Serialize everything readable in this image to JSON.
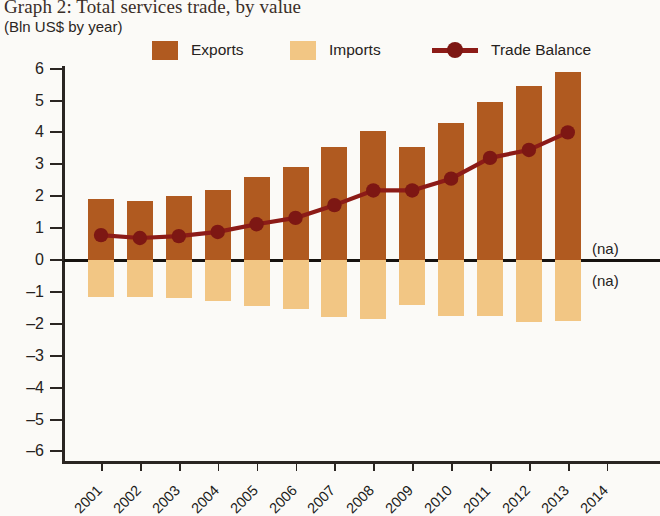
{
  "header": {
    "title": "Graph 2: Total services trade, by value",
    "subtitle": "(Bln US$ by year)"
  },
  "legend": {
    "items": [
      {
        "label": "Exports",
        "type": "swatch",
        "color": "#b05a20",
        "icon": "square-swatch-icon"
      },
      {
        "label": "Imports",
        "type": "swatch",
        "color": "#f2c684",
        "icon": "square-swatch-icon"
      },
      {
        "label": "Trade Balance",
        "type": "line",
        "color": "#8c1b17",
        "icon": "line-marker-icon"
      }
    ]
  },
  "annotations": {
    "na_above": "(na)",
    "na_below": "(na)"
  },
  "chart_data": {
    "type": "bar",
    "title": "Graph 2: Total services trade, by value",
    "subtitle": "(Bln US$ by year)",
    "xlabel": "",
    "ylabel": "",
    "ylim": [
      -6,
      6
    ],
    "ytick_labels": [
      "6",
      "5",
      "4",
      "3",
      "2",
      "1",
      "0",
      "–1",
      "–2",
      "–3",
      "–4",
      "–5",
      "–6"
    ],
    "ytick_values": [
      6,
      5,
      4,
      3,
      2,
      1,
      0,
      -1,
      -2,
      -3,
      -4,
      -5,
      -6
    ],
    "grid": false,
    "legend_position": "top",
    "categories": [
      "2001",
      "2002",
      "2003",
      "2004",
      "2005",
      "2006",
      "2007",
      "2008",
      "2009",
      "2010",
      "2011",
      "2012",
      "2013",
      "2014"
    ],
    "series": [
      {
        "name": "Exports",
        "kind": "bar",
        "color": "#b05a20",
        "values": [
          1.9,
          1.85,
          2.0,
          2.2,
          2.6,
          2.9,
          3.55,
          4.05,
          3.55,
          4.3,
          4.95,
          5.45,
          5.9,
          null
        ]
      },
      {
        "name": "Imports",
        "kind": "bar",
        "color": "#f2c684",
        "values": [
          -1.15,
          -1.15,
          -1.2,
          -1.3,
          -1.45,
          -1.55,
          -1.8,
          -1.85,
          -1.4,
          -1.75,
          -1.75,
          -1.95,
          -1.9,
          null
        ]
      },
      {
        "name": "Trade Balance",
        "kind": "line",
        "color": "#8c1b17",
        "values": [
          0.78,
          0.69,
          0.75,
          0.88,
          1.12,
          1.32,
          1.72,
          2.18,
          2.18,
          2.55,
          3.2,
          3.45,
          4.0,
          null
        ]
      }
    ],
    "missing_note": "2014 values not available (na)"
  }
}
